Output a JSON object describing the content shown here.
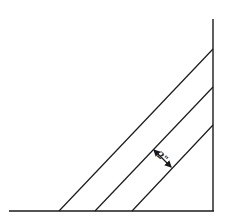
{
  "diagram": {
    "dimension_label": "2\"",
    "line_color": "#1a1a1a",
    "lines": {
      "baseline": {
        "x1": 9,
        "y1": 211,
        "x2": 214,
        "y2": 211
      },
      "wall": {
        "x1": 213,
        "y1": 19,
        "x2": 213,
        "y2": 211
      },
      "diagonals": [
        {
          "x1": 59,
          "y1": 211,
          "x2": 213,
          "y2": 49
        },
        {
          "x1": 95,
          "y1": 211,
          "x2": 213,
          "y2": 87
        },
        {
          "x1": 132,
          "y1": 211,
          "x2": 213,
          "y2": 125
        }
      ]
    },
    "dimension_arrow": {
      "x1": 153,
      "y1": 149,
      "x2": 172,
      "y2": 168
    }
  }
}
